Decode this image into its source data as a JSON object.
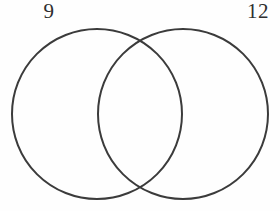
{
  "diagram": {
    "type": "venn-two-set",
    "background_color": "#fefefe",
    "stroke_color": "#3b3b3b",
    "stroke_width": 2,
    "left_set": {
      "label": "9",
      "center_x": 97,
      "center_y": 114,
      "radius": 85
    },
    "right_set": {
      "label": "12",
      "center_x": 183,
      "center_y": 114,
      "radius": 85
    }
  }
}
